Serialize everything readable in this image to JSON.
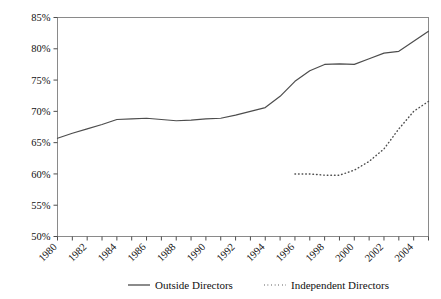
{
  "chart_data": {
    "type": "line",
    "title": "",
    "xlabel": "",
    "ylabel": "",
    "xlim": [
      1980,
      2005
    ],
    "ylim": [
      0.5,
      0.85
    ],
    "grid": false,
    "legend_position": "bottom",
    "y_tick_labels": [
      "85%",
      "80%",
      "75%",
      "70%",
      "65%",
      "60%",
      "55%",
      "50%"
    ],
    "y_tick_values": [
      0.85,
      0.8,
      0.75,
      0.7,
      0.65,
      0.6,
      0.55,
      0.5
    ],
    "x_tick_labels": [
      "1980",
      "1982",
      "1984",
      "1986",
      "1988",
      "1990",
      "1992",
      "1994",
      "1996",
      "1998",
      "2000",
      "2002",
      "2004"
    ],
    "x_tick_values": [
      1980,
      1982,
      1984,
      1986,
      1988,
      1990,
      1992,
      1994,
      1996,
      1998,
      2000,
      2002,
      2004
    ],
    "x_minor_ticks": [
      1981,
      1983,
      1985,
      1987,
      1989,
      1991,
      1993,
      1995,
      1997,
      1999,
      2001,
      2003,
      2005
    ],
    "series": [
      {
        "name": "Outside Directors",
        "style": "solid",
        "color": "#4d4d4d",
        "x": [
          1980,
          1981,
          1982,
          1983,
          1984,
          1985,
          1986,
          1987,
          1988,
          1989,
          1990,
          1991,
          1992,
          1993,
          1994,
          1995,
          1996,
          1997,
          1998,
          1999,
          2000,
          2001,
          2002,
          2003,
          2004,
          2005
        ],
        "values": [
          0.657,
          0.665,
          0.672,
          0.679,
          0.687,
          0.688,
          0.689,
          0.687,
          0.685,
          0.686,
          0.688,
          0.689,
          0.694,
          0.7,
          0.706,
          0.724,
          0.748,
          0.765,
          0.775,
          0.776,
          0.775,
          0.784,
          0.793,
          0.796,
          0.812,
          0.828
        ]
      },
      {
        "name": "Independent Directors",
        "style": "dotted",
        "color": "#4d4d4d",
        "x": [
          1996,
          1997,
          1998,
          1999,
          2000,
          2001,
          2002,
          2003,
          2004,
          2005
        ],
        "values": [
          0.6,
          0.6,
          0.598,
          0.598,
          0.606,
          0.62,
          0.64,
          0.672,
          0.7,
          0.716
        ]
      }
    ]
  },
  "legend": {
    "items": [
      {
        "label": "Outside Directors",
        "style": "solid"
      },
      {
        "label": "Independent Directors",
        "style": "dotted"
      }
    ]
  }
}
